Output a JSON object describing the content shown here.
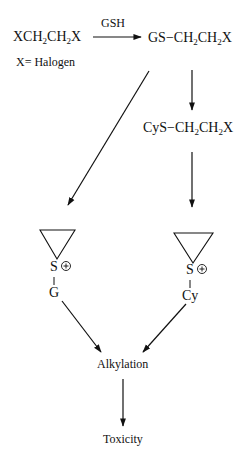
{
  "diagram": {
    "nodes": {
      "substrate": {
        "prefix": "XCH",
        "sub1": "2",
        "mid": "CH",
        "sub2": "2",
        "suffix": "X"
      },
      "halogen_note": "X= Halogen",
      "reagent": "GSH",
      "gs_conjugate": {
        "prefix": "GS−CH",
        "sub1": "2",
        "mid": "CH",
        "sub2": "2",
        "suffix": "X"
      },
      "cys_conjugate": {
        "prefix": "CyS−CH",
        "sub1": "2",
        "mid": "CH",
        "sub2": "2",
        "suffix": "X"
      },
      "episulfonium_gs": {
        "sulfur": "S",
        "charge": "⊕",
        "substituent": "G"
      },
      "episulfonium_cys": {
        "sulfur": "S",
        "charge": "⊕",
        "substituent": "Cy"
      },
      "alkylation": "Alkylation",
      "toxicity": "Toxicity"
    },
    "edges": [
      {
        "from": "substrate",
        "to": "gs_conjugate",
        "label": "GSH"
      },
      {
        "from": "gs_conjugate",
        "to": "episulfonium_gs"
      },
      {
        "from": "gs_conjugate",
        "to": "cys_conjugate"
      },
      {
        "from": "cys_conjugate",
        "to": "episulfonium_cys"
      },
      {
        "from": "episulfonium_gs",
        "to": "alkylation"
      },
      {
        "from": "episulfonium_cys",
        "to": "alkylation"
      },
      {
        "from": "alkylation",
        "to": "toxicity"
      }
    ],
    "colors": {
      "ink": "#111111",
      "background": "#ffffff"
    }
  }
}
